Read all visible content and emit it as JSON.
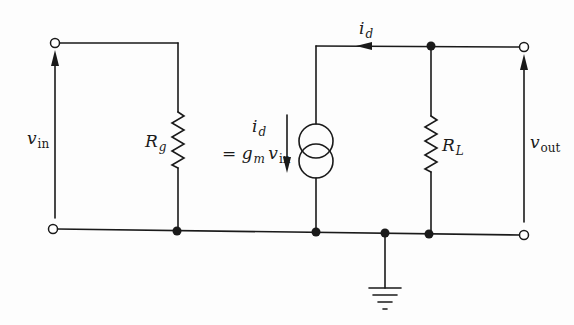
{
  "diagram": {
    "type": "small-signal equivalent circuit",
    "stroke_color": "#1a1a1a",
    "background": "#fdfdfd",
    "labels": {
      "vin": {
        "main": "v",
        "sub": "in"
      },
      "rg": {
        "main": "R",
        "sub": "g"
      },
      "id_top": {
        "main": "i",
        "sub": "d"
      },
      "source_current": {
        "main": "i",
        "sub": "d"
      },
      "source_eq": {
        "prefix": "= ",
        "gm_main": "g",
        "gm_sub": "m",
        "v_main": "v",
        "v_sub": "in"
      },
      "rl": {
        "main": "R",
        "sub": "L"
      },
      "vout": {
        "main": "v",
        "sub": "out"
      }
    },
    "components": [
      {
        "id": "input-port",
        "kind": "port",
        "label": "v_in"
      },
      {
        "id": "Rg",
        "kind": "resistor",
        "label": "R_g"
      },
      {
        "id": "current-source",
        "kind": "dependent current source",
        "label": "i_d = g_m v_in"
      },
      {
        "id": "RL",
        "kind": "resistor",
        "label": "R_L"
      },
      {
        "id": "output-port",
        "kind": "port",
        "label": "v_out"
      },
      {
        "id": "ground",
        "kind": "ground"
      }
    ]
  }
}
